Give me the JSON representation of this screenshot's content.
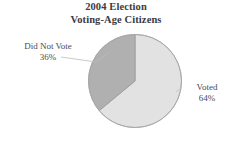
{
  "chart_data": {
    "type": "pie",
    "title": "2004 Election Voting-Age Citizens",
    "title_lines": [
      "2004 Election",
      "Voting-Age Citizens"
    ],
    "categories": [
      "Voted",
      "Did Not Vote"
    ],
    "values": [
      64,
      36
    ],
    "value_unit": "%",
    "slices": [
      {
        "label": "Voted",
        "value": 64,
        "value_text": "64%",
        "color": "#e2e2e2",
        "start_angle_deg": 0,
        "end_angle_deg": 230.4
      },
      {
        "label": "Did Not Vote",
        "value": 36,
        "value_text": "36%",
        "color": "#b0b0b0",
        "start_angle_deg": 230.4,
        "end_angle_deg": 360
      }
    ],
    "legend": "none",
    "labels_position": "outside-with-leader-lines",
    "grid": false,
    "xlabel": "",
    "ylabel": ""
  },
  "title": {
    "line1": "2004 Election",
    "line2": "Voting-Age Citizens"
  },
  "labels": {
    "did_not_vote": {
      "name": "Did Not Vote",
      "value": "36%"
    },
    "voted": {
      "name": "Voted",
      "value": "64%"
    }
  },
  "colors": {
    "voted_slice": "#e2e2e2",
    "did_not_vote_slice": "#b0b0b0",
    "slice_outline": "#9a9a9a",
    "leader_line": "#b4b4b4",
    "text": "#4a4a52",
    "title_text": "#3b3b43",
    "background": "#ffffff"
  }
}
